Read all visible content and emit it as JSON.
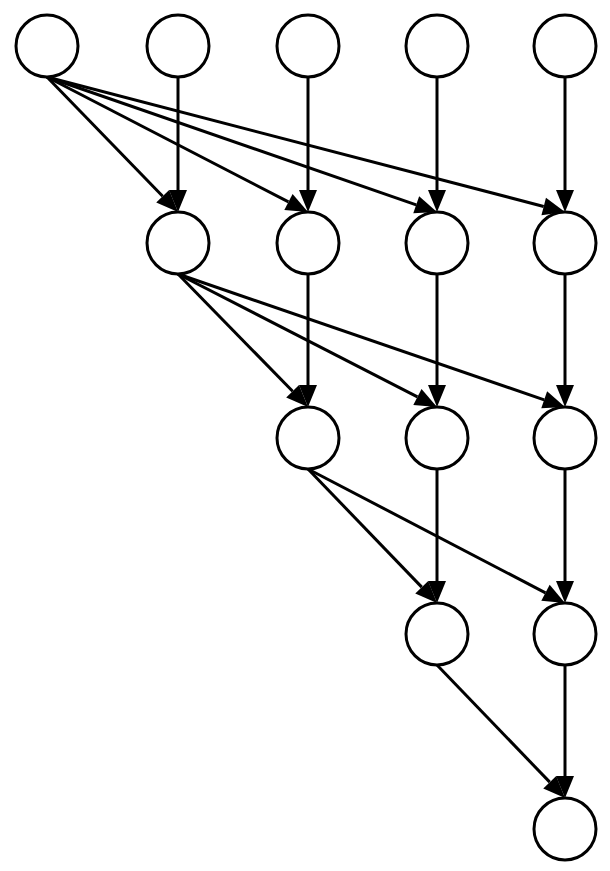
{
  "diagram": {
    "type": "directed-acyclic-graph",
    "colors": {
      "stroke": "#000000",
      "fill": "#ffffff",
      "background": "#ffffff"
    },
    "node_radius": 31,
    "columns_x": [
      47,
      178,
      308,
      437,
      565
    ],
    "rows_y": [
      46,
      243,
      438,
      634,
      829
    ],
    "nodes": [
      {
        "id": "n0_0",
        "row": 0,
        "col": 0,
        "label": ""
      },
      {
        "id": "n0_1",
        "row": 0,
        "col": 1,
        "label": ""
      },
      {
        "id": "n0_2",
        "row": 0,
        "col": 2,
        "label": ""
      },
      {
        "id": "n0_3",
        "row": 0,
        "col": 3,
        "label": ""
      },
      {
        "id": "n0_4",
        "row": 0,
        "col": 4,
        "label": ""
      },
      {
        "id": "n1_1",
        "row": 1,
        "col": 1,
        "label": ""
      },
      {
        "id": "n1_2",
        "row": 1,
        "col": 2,
        "label": ""
      },
      {
        "id": "n1_3",
        "row": 1,
        "col": 3,
        "label": ""
      },
      {
        "id": "n1_4",
        "row": 1,
        "col": 4,
        "label": ""
      },
      {
        "id": "n2_2",
        "row": 2,
        "col": 2,
        "label": ""
      },
      {
        "id": "n2_3",
        "row": 2,
        "col": 3,
        "label": ""
      },
      {
        "id": "n2_4",
        "row": 2,
        "col": 4,
        "label": ""
      },
      {
        "id": "n3_3",
        "row": 3,
        "col": 3,
        "label": ""
      },
      {
        "id": "n3_4",
        "row": 3,
        "col": 4,
        "label": ""
      },
      {
        "id": "n4_4",
        "row": 4,
        "col": 4,
        "label": ""
      }
    ],
    "edges": [
      {
        "from": "n0_0",
        "to": "n1_1"
      },
      {
        "from": "n0_0",
        "to": "n1_2"
      },
      {
        "from": "n0_0",
        "to": "n1_3"
      },
      {
        "from": "n0_0",
        "to": "n1_4"
      },
      {
        "from": "n0_1",
        "to": "n1_1"
      },
      {
        "from": "n0_2",
        "to": "n1_2"
      },
      {
        "from": "n0_3",
        "to": "n1_3"
      },
      {
        "from": "n0_4",
        "to": "n1_4"
      },
      {
        "from": "n1_1",
        "to": "n2_2"
      },
      {
        "from": "n1_1",
        "to": "n2_3"
      },
      {
        "from": "n1_1",
        "to": "n2_4"
      },
      {
        "from": "n1_2",
        "to": "n2_2"
      },
      {
        "from": "n1_3",
        "to": "n2_3"
      },
      {
        "from": "n1_4",
        "to": "n2_4"
      },
      {
        "from": "n2_2",
        "to": "n3_3"
      },
      {
        "from": "n2_2",
        "to": "n3_4"
      },
      {
        "from": "n2_3",
        "to": "n3_3"
      },
      {
        "from": "n2_4",
        "to": "n3_4"
      },
      {
        "from": "n3_3",
        "to": "n4_4"
      },
      {
        "from": "n3_4",
        "to": "n4_4"
      }
    ]
  }
}
